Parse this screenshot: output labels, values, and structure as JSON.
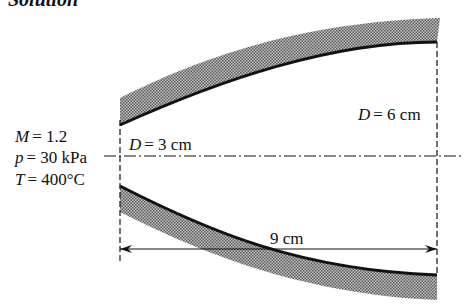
{
  "heading": "Solution",
  "inlet_conditions": {
    "mach": {
      "symbol": "M",
      "value": "= 1.2"
    },
    "pressure": {
      "symbol": "p",
      "value": "= 30 kPa"
    },
    "temperature": {
      "symbol": "T",
      "value": "= 400°C"
    }
  },
  "inlet_diameter": {
    "symbol": "D",
    "value": "= 3 cm"
  },
  "outlet_diameter": {
    "symbol": "D",
    "value": "= 6 cm"
  },
  "length_dimension": "9 cm",
  "colors": {
    "line": "#111111",
    "hatch": "#7a7a7a",
    "background": "#ffffff"
  }
}
